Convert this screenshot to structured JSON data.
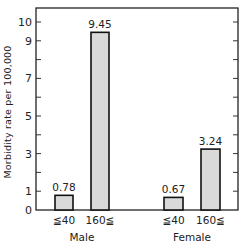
{
  "chart_data": {
    "type": "bar",
    "title": "",
    "xlabel": "",
    "ylabel": "Morbidity rate per 100,000",
    "ylim": [
      0,
      10.7
    ],
    "yticks_labeled": [
      0,
      1,
      3,
      5,
      7,
      9,
      10
    ],
    "yticks_all": [
      0,
      1,
      2,
      3,
      4,
      5,
      6,
      7,
      8,
      9,
      10
    ],
    "grid": false,
    "groups": [
      "Male",
      "Female"
    ],
    "categories": [
      "≦40",
      "160≦",
      "≦40",
      "160≦"
    ],
    "bars": [
      {
        "group": "Male",
        "category": "≦40",
        "value": 0.78,
        "label": "0.78"
      },
      {
        "group": "Male",
        "category": "160≦",
        "value": 9.45,
        "label": "9.45"
      },
      {
        "group": "Female",
        "category": "≦40",
        "value": 0.67,
        "label": "0.67"
      },
      {
        "group": "Female",
        "category": "160≦",
        "value": 3.24,
        "label": "3.24"
      }
    ],
    "bar_color": "#d9d9d9",
    "bar_edge_color": "#111111"
  }
}
